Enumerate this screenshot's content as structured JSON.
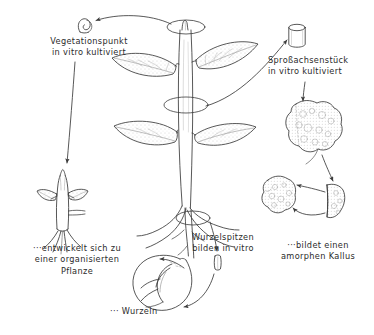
{
  "diagram": {
    "language": "de",
    "ink_color": "#3a3a3a",
    "text_color": "#2b2b2b",
    "labels": {
      "vegetationspunkt": "Vegetationspunkt\nin vitro kultiviert",
      "sprossachsenstueck": "Sproßachsenstück\nin vitro kultiviert",
      "entwickelt_pflanze": "···entwickelt sich zu\neiner organisierten\nPflanze",
      "wurzelspitzen": "Wurzelspitzen\nbilden in vitro",
      "wurzeln": "··· Wurzeln",
      "amorpher_kallus": "···bildet einen\namorphen Kallus"
    },
    "nodes": [
      {
        "id": "shoot-apex-explant",
        "name": "Vegetationspunkt (Explantat)",
        "x": 85,
        "y": 26
      },
      {
        "id": "whole-plant",
        "name": "Ganze Pflanze mit Blättern und Wurzeln",
        "x": 185,
        "y": 125
      },
      {
        "id": "stem-segment-explant",
        "name": "Sproßachsenstück (Zylinder)",
        "x": 297,
        "y": 36
      },
      {
        "id": "large-callus",
        "name": "Großer amorpher Kallus",
        "x": 310,
        "y": 130
      },
      {
        "id": "callus-piece-left",
        "name": "Kallusstück (Subkultur)",
        "x": 281,
        "y": 196
      },
      {
        "id": "callus-piece-right",
        "name": "Kallusstück (Teilstück)",
        "x": 333,
        "y": 203
      },
      {
        "id": "regenerated-plantlet",
        "name": "Organisierte Pflanze (Regenerat)",
        "x": 62,
        "y": 200
      },
      {
        "id": "root-vessel",
        "name": "Wurzelkultur im Gefäß",
        "x": 168,
        "y": 275
      },
      {
        "id": "root-tip-explant",
        "name": "Wurzelspitze (Explantat)",
        "x": 218,
        "y": 262
      }
    ],
    "markers": [
      {
        "id": "marker-apex",
        "name": "Entnahmestelle Vegetationspunkt",
        "cx": 186,
        "cy": 27,
        "rx": 19,
        "ry": 7
      },
      {
        "id": "marker-stem",
        "name": "Entnahmestelle Sproßachse",
        "cx": 186,
        "cy": 105,
        "rx": 22,
        "ry": 8
      },
      {
        "id": "marker-roottip",
        "name": "Entnahmestelle Wurzelspitze",
        "cx": 193,
        "cy": 218,
        "rx": 17,
        "ry": 7
      }
    ],
    "flows": [
      {
        "from": "whole-plant",
        "to": "shoot-apex-explant",
        "label": "Vegetationspunkt entnehmen"
      },
      {
        "from": "shoot-apex-explant",
        "to": "regenerated-plantlet",
        "label": "entwickelt sich zu einer organisierten Pflanze"
      },
      {
        "from": "whole-plant",
        "to": "stem-segment-explant",
        "label": "Sproßachsenstück entnehmen"
      },
      {
        "from": "stem-segment-explant",
        "to": "large-callus",
        "label": "bildet amorphen Kallus"
      },
      {
        "from": "large-callus",
        "to": "callus-piece-right",
        "label": "Teilstück"
      },
      {
        "from": "callus-piece-right",
        "to": "callus-piece-left",
        "label": "Subkultur"
      },
      {
        "from": "callus-piece-left",
        "to": "callus-piece-right",
        "label": "Subkultur"
      },
      {
        "from": "whole-plant",
        "to": "root-tip-explant",
        "label": "Wurzelspitze entnehmen"
      },
      {
        "from": "root-tip-explant",
        "to": "root-vessel",
        "label": "bildet Wurzeln in vitro"
      }
    ]
  }
}
